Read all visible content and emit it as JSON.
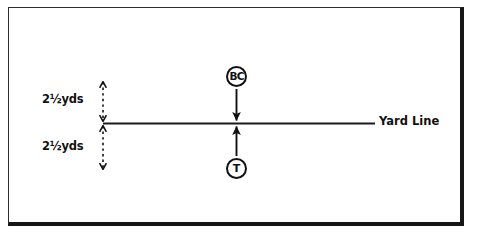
{
  "diagram": {
    "background_color": "#ffffff",
    "ink_color": "#111111",
    "frame": {
      "border_color": "#2e2e2e",
      "shadow_color": "#161616"
    },
    "yard_line": {
      "label": "Yard Line",
      "color": "#1a1a1a",
      "x_start": 103,
      "x_end": 375,
      "y": 123
    },
    "dimensions": [
      {
        "id": "top-distance",
        "label": "2½yds",
        "value": 2.5,
        "unit": "yds",
        "side": "above-yard-line",
        "arrow_style": "dashed-double-headed"
      },
      {
        "id": "bottom-distance",
        "label": "2½yds",
        "value": 2.5,
        "unit": "yds",
        "side": "below-yard-line",
        "arrow_style": "dashed-double-headed"
      }
    ],
    "players": [
      {
        "id": "ball-carrier",
        "label": "BC",
        "name": "ball-carrier-marker",
        "position": "above-yard-line",
        "motion": "down-toward-yard-line"
      },
      {
        "id": "tackler",
        "label": "T",
        "name": "tackler-marker",
        "position": "below-yard-line",
        "motion": "up-toward-yard-line"
      }
    ],
    "motion_arrows": [
      {
        "id": "bc-arrow",
        "from": "BC",
        "to": "Yard Line",
        "direction": "down"
      },
      {
        "id": "t-arrow",
        "from": "T",
        "to": "Yard Line",
        "direction": "up"
      }
    ]
  }
}
